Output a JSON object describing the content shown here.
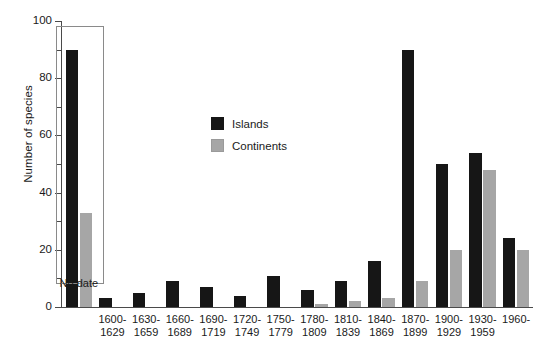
{
  "chart_data": {
    "type": "bar",
    "title": "",
    "xlabel": "",
    "ylabel": "Number of species",
    "ylim": [
      0,
      100
    ],
    "yticks": [
      0,
      20,
      40,
      60,
      80,
      100
    ],
    "ytick_labels": [
      "0",
      "20",
      "40",
      "60",
      "80",
      "100"
    ],
    "yminor_ticks": [
      10,
      30,
      50,
      70,
      90
    ],
    "grid": false,
    "legend_position": "upper-center",
    "categories": [
      "No date",
      "1600-1629",
      "1630-1659",
      "1660-1689",
      "1690-1719",
      "1720-1749",
      "1750-1779",
      "1780-1809",
      "1810-1839",
      "1840-1869",
      "1870-1899",
      "1900-1929",
      "1930-1959",
      "1960-"
    ],
    "category_lines": [
      [
        "No date",
        ""
      ],
      [
        "1600-",
        "1629"
      ],
      [
        "1630-",
        "1659"
      ],
      [
        "1660-",
        "1689"
      ],
      [
        "1690-",
        "1719"
      ],
      [
        "1720-",
        "1749"
      ],
      [
        "1750-",
        "1779"
      ],
      [
        "1780-",
        "1809"
      ],
      [
        "1810-",
        "1839"
      ],
      [
        "1840-",
        "1869"
      ],
      [
        "1870-",
        "1899"
      ],
      [
        "1900-",
        "1929"
      ],
      [
        "1930-",
        "1959"
      ],
      [
        "1960-",
        ""
      ]
    ],
    "series": [
      {
        "name": "Islands",
        "color": "#161616",
        "values": [
          90,
          3,
          5,
          9,
          7,
          4,
          11,
          6,
          9,
          16,
          90,
          50,
          54,
          24
        ]
      },
      {
        "name": "Continents",
        "color": "#a6a6a6",
        "values": [
          33,
          0,
          0,
          0,
          0,
          0,
          0,
          1,
          2,
          3,
          9,
          20,
          48,
          20
        ]
      }
    ],
    "annotations": [
      {
        "name": "no-date-box",
        "text": "No date",
        "description": "Rectangular outline enclosing the No date group, separated from the dated time-period groups"
      }
    ]
  },
  "legend": {
    "entries": [
      {
        "label": "Islands",
        "color": "#161616"
      },
      {
        "label": "Continents",
        "color": "#a6a6a6"
      }
    ]
  }
}
